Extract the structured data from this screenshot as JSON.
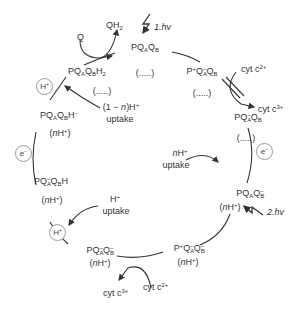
{
  "diagram": {
    "states": [
      {
        "id": "s1",
        "base": "PQ",
        "parts": [
          [
            "Q",
            "A",
            ""
          ],
          [
            "Q",
            "B",
            ""
          ]
        ],
        "prefix": "",
        "suffix": "",
        "sub": "(.....)",
        "text": "PQAQB (.....)"
      },
      {
        "id": "s2",
        "text": "P+QA−QB (.....)"
      },
      {
        "id": "s3",
        "text": "PQA−QB (.....)"
      },
      {
        "id": "s4",
        "text": "PQAQB− (nH+)"
      },
      {
        "id": "s5",
        "text": "P+QAQB− (nH+)"
      },
      {
        "id": "s6",
        "text": "PQA−QB− (nH+)"
      },
      {
        "id": "s7",
        "text": "PQA−QBH (nH+)"
      },
      {
        "id": "s8",
        "text": "PQAQBH− (nH+)"
      },
      {
        "id": "s9",
        "text": "PQAQBH2 (.....)"
      }
    ],
    "annotations": {
      "flash1": "1.hv",
      "flash2": "2.hv",
      "q": "Q",
      "qh2": "QH",
      "qh2_sub": "2",
      "cyt_c2_top": "cyt c",
      "cyt_c2_top_sup": "2+",
      "cyt_c3_top": "cyt c",
      "cyt_c3_top_sup": "3+",
      "cyt_c2_bottom": "cyt c",
      "cyt_c2_bottom_sup": "2+",
      "cyt_c3_bottom": "cyt c",
      "cyt_c3_bottom_sup": "3+",
      "n_uptake_line1": "nH",
      "n_uptake_line2": "uptake",
      "h_uptake_line1": "H",
      "h_uptake_line2": "uptake",
      "one_minus_n_line1": "(1 − n)H",
      "one_minus_n_line2": "uptake",
      "ellipsis": "(.....)",
      "nh": "(nH",
      "nh_close": ")"
    },
    "badges": {
      "e_right": "e",
      "e_left": "e",
      "h_top_left": "H",
      "h_bottom_left": "H"
    }
  }
}
